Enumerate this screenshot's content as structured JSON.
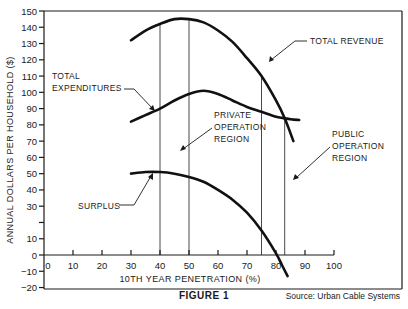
{
  "chart_data": {
    "type": "line",
    "title": "FIGURE 1",
    "xlabel": "10TH YEAR PENETRATION (%)",
    "ylabel": "ANNUAL DOLLARS PER HOUSEHOLD ($)",
    "xlim": [
      0,
      100
    ],
    "ylim": [
      -20,
      150
    ],
    "x_ticks": [
      0,
      10,
      20,
      30,
      40,
      50,
      60,
      70,
      80,
      90,
      100
    ],
    "y_ticks": [
      150,
      140,
      130,
      120,
      110,
      100,
      90,
      80,
      70,
      60,
      50,
      40,
      30,
      10,
      0,
      -10,
      -20
    ],
    "grid": false,
    "series": [
      {
        "name": "TOTAL REVENUE",
        "x": [
          30,
          35,
          40,
          45,
          50,
          55,
          60,
          65,
          70,
          75,
          80,
          83,
          86
        ],
        "values": [
          132,
          138,
          142,
          145,
          145,
          143,
          138,
          131,
          121,
          110,
          95,
          84,
          70
        ]
      },
      {
        "name": "TOTAL EXPENDITURES",
        "x": [
          30,
          35,
          40,
          45,
          50,
          55,
          60,
          65,
          70,
          75,
          80,
          85,
          88
        ],
        "values": [
          82,
          86,
          90,
          95,
          99,
          101,
          99,
          95,
          91,
          88,
          85,
          83.5,
          83
        ]
      },
      {
        "name": "SURPLUS",
        "x": [
          30,
          35,
          40,
          45,
          50,
          55,
          60,
          65,
          70,
          75,
          80,
          82,
          84
        ],
        "values": [
          50,
          51,
          51,
          50,
          48,
          45,
          40,
          34,
          26,
          15,
          1,
          -6,
          -13
        ]
      }
    ],
    "vertical_lines": [
      40,
      50,
      75,
      83
    ],
    "annotations": [
      {
        "text": "TOTAL REVENUE",
        "points_to": "Total revenue curve"
      },
      {
        "text": "TOTAL EXPENDITURES",
        "points_to": "Total expenditures curve"
      },
      {
        "text": "PRIVATE OPERATION REGION",
        "points_to": "region between 40% and 50%"
      },
      {
        "text": "PUBLIC OPERATION REGION",
        "points_to": "region between 75% and 83%"
      },
      {
        "text": "SURPLUS",
        "points_to": "Surplus curve"
      }
    ],
    "source": "Source:  Urban Cable Systems"
  },
  "labels": {
    "total_revenue": "TOTAL REVENUE",
    "total_expenditures_1": "TOTAL",
    "total_expenditures_2": "EXPENDITURES",
    "private_1": "PRIVATE",
    "private_2": "OPERATION",
    "private_3": "REGION",
    "public_1": "PUBLIC",
    "public_2": "OPERATION",
    "public_3": "REGION",
    "surplus": "SURPLUS"
  },
  "axes": {
    "xlabel": "10TH YEAR PENETRATION (%)",
    "ylabel": "ANNUAL DOLLARS PER HOUSEHOLD ($)"
  },
  "caption": "FIGURE 1",
  "source": "Source:  Urban Cable Systems"
}
